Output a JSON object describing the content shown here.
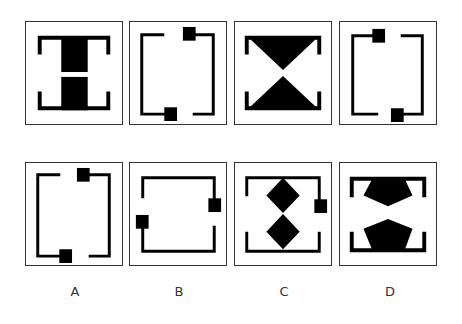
{
  "puzzle": {
    "sequence": [
      {
        "id": "seq-1",
        "description": "H shape: two black rectangles in corner brackets"
      },
      {
        "id": "seq-2",
        "description": "Open bracket frame with two small squares (top-right, bottom-left)"
      },
      {
        "id": "seq-3",
        "description": "Two triangles pointing to center (hourglass) in corner brackets"
      },
      {
        "id": "seq-4",
        "description": "Open bracket frame with two small squares (top-left, bottom-right)"
      }
    ],
    "options": [
      {
        "label": "A",
        "description": "Open bracket frame with squares at top-right and bottom-center-left"
      },
      {
        "label": "B",
        "description": "Open bracket frame rotated, squares at left and right sides"
      },
      {
        "label": "C",
        "description": "Two diamonds stacked vertically with a square on the right side"
      },
      {
        "label": "D",
        "description": "Two pentagons pointing toward each other in corner brackets"
      }
    ]
  },
  "colors": {
    "fill": "#000000",
    "frame": "#333333",
    "background": "#ffffff"
  }
}
